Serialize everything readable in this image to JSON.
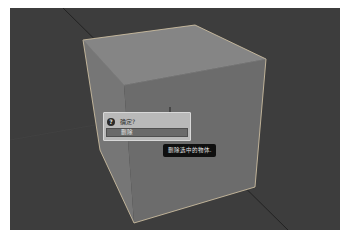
{
  "viewport": {
    "background": "#3d3d3d",
    "object": "cube"
  },
  "dialog": {
    "icon": "question-icon",
    "icon_glyph": "?",
    "title": "确定?",
    "button_label": "删除",
    "button_left_hint": "",
    "button_right_hint": ""
  },
  "tooltip": {
    "text": "删除选中的物体."
  },
  "cursor": {
    "icon": "crosshair-cursor-icon"
  }
}
